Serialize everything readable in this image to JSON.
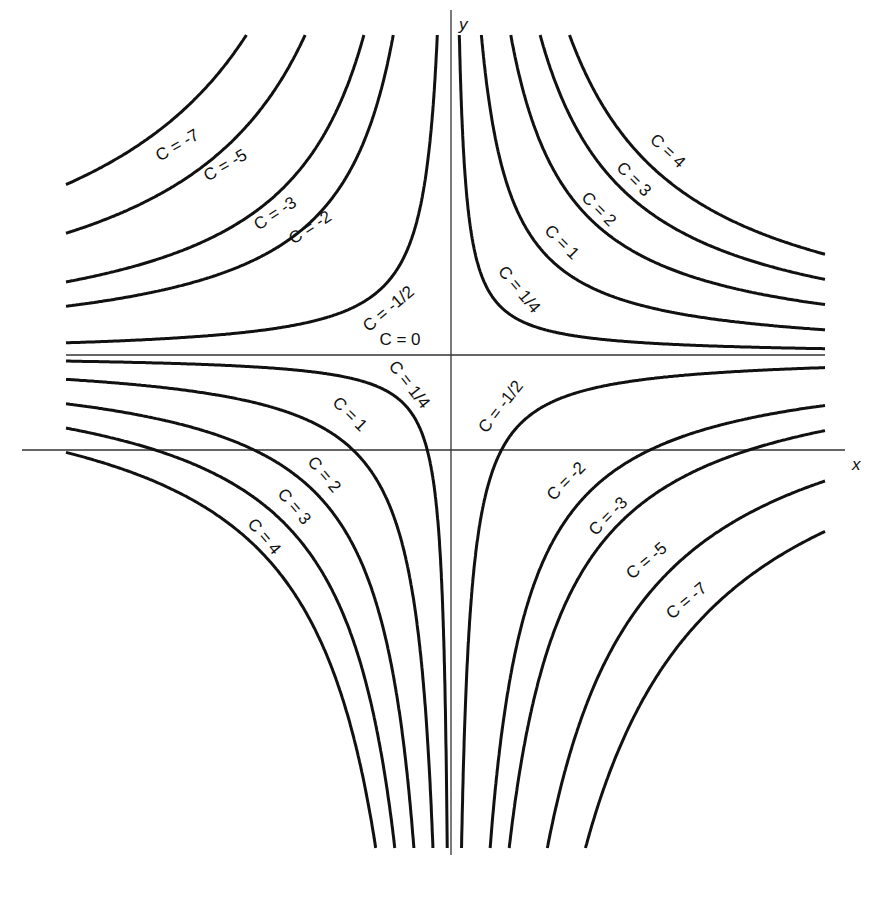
{
  "chart_data": {
    "type": "line",
    "title": "",
    "xlabel": "x",
    "ylabel": "y",
    "grid": false,
    "legend": "none (inline curve labels)",
    "origin_px": {
      "x": 452,
      "y": 450
    },
    "asymptote_center_px": {
      "x": 452,
      "y": 355
    },
    "scale_k": -9400,
    "x_range_px": [
      66,
      825
    ],
    "y_range_px": [
      35,
      848
    ],
    "series": [
      {
        "name": "C = -7",
        "C": -7
      },
      {
        "name": "C = -5",
        "C": -5
      },
      {
        "name": "C = -3",
        "C": -3
      },
      {
        "name": "C = -2",
        "C": -2
      },
      {
        "name": "C = -1/2",
        "C": -0.5
      },
      {
        "name": "C = 0",
        "C": 0
      },
      {
        "name": "C = 1/4",
        "C": 0.25
      },
      {
        "name": "C = 1",
        "C": 1
      },
      {
        "name": "C = 2",
        "C": 2
      },
      {
        "name": "C = 3",
        "C": 3
      },
      {
        "name": "C = 4",
        "C": 4
      }
    ],
    "annotations": [
      {
        "text": "C = -7",
        "x": 180,
        "y": 150,
        "rot": -30
      },
      {
        "text": "C = -5",
        "x": 228,
        "y": 170,
        "rot": -30
      },
      {
        "text": "C = -3",
        "x": 278,
        "y": 218,
        "rot": -33
      },
      {
        "text": "C = -2",
        "x": 313,
        "y": 232,
        "rot": -33
      },
      {
        "text": "C = -1/2",
        "x": 392,
        "y": 313,
        "rot": -40
      },
      {
        "text": "C = 0",
        "x": 400,
        "y": 345,
        "rot": 0
      },
      {
        "text": "C = 1/4",
        "x": 515,
        "y": 293,
        "rot": 50
      },
      {
        "text": "C = 1",
        "x": 558,
        "y": 246,
        "rot": 45
      },
      {
        "text": "C = 2",
        "x": 595,
        "y": 213,
        "rot": 45
      },
      {
        "text": "C = 3",
        "x": 630,
        "y": 183,
        "rot": 45
      },
      {
        "text": "C = 4",
        "x": 664,
        "y": 155,
        "rot": 43
      },
      {
        "text": "C = 1/4",
        "x": 405,
        "y": 388,
        "rot": 52
      },
      {
        "text": "C = 1",
        "x": 346,
        "y": 418,
        "rot": 45
      },
      {
        "text": "C = 2",
        "x": 320,
        "y": 478,
        "rot": 50
      },
      {
        "text": "C = 3",
        "x": 290,
        "y": 510,
        "rot": 50
      },
      {
        "text": "C = 4",
        "x": 260,
        "y": 540,
        "rot": 50
      },
      {
        "text": "C = -1/2",
        "x": 505,
        "y": 410,
        "rot": -52
      },
      {
        "text": "C = -2",
        "x": 570,
        "y": 485,
        "rot": -45
      },
      {
        "text": "C = -3",
        "x": 612,
        "y": 520,
        "rot": -45
      },
      {
        "text": "C = -5",
        "x": 650,
        "y": 565,
        "rot": -40
      },
      {
        "text": "C = -7",
        "x": 690,
        "y": 605,
        "rot": -40
      }
    ]
  },
  "axes": {
    "x_label": "x",
    "y_label": "y"
  }
}
